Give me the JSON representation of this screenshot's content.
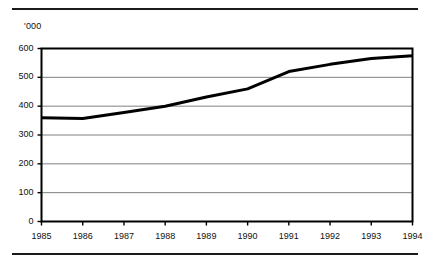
{
  "figure": {
    "unit_label": "'000",
    "top_rule": true,
    "bottom_rule": true
  },
  "chart_data": {
    "type": "line",
    "title": "",
    "subtitle": "",
    "xlabel": "",
    "ylabel": "'000",
    "categories": [
      "1985",
      "1986",
      "1987",
      "1988",
      "1989",
      "1990",
      "1991",
      "1992",
      "1993",
      "1994"
    ],
    "x": [
      1985,
      1986,
      1987,
      1988,
      1989,
      1990,
      1991,
      1992,
      1993,
      1994
    ],
    "values": [
      360,
      357,
      378,
      400,
      432,
      460,
      520,
      545,
      565,
      575
    ],
    "series": [
      {
        "name": "",
        "values": [
          360,
          357,
          378,
          400,
          432,
          460,
          520,
          545,
          565,
          575
        ]
      }
    ],
    "ylim": [
      0,
      600
    ],
    "xlim": [
      1985,
      1994
    ],
    "yticks": [
      0,
      100,
      200,
      300,
      400,
      500,
      600
    ],
    "ytick_labels": [
      "0",
      "100",
      "200",
      "300",
      "400",
      "500",
      "600"
    ],
    "xtick_labels": [
      "1985",
      "1986",
      "1987",
      "1988",
      "1989",
      "1990",
      "1991",
      "1992",
      "1993",
      "1994"
    ],
    "grid": "horizontal",
    "legend": "none",
    "line_color": "#000000",
    "line_width": 3,
    "grid_color": "#808080",
    "axis_color": "#000000",
    "background": "#ffffff",
    "annotations": []
  }
}
